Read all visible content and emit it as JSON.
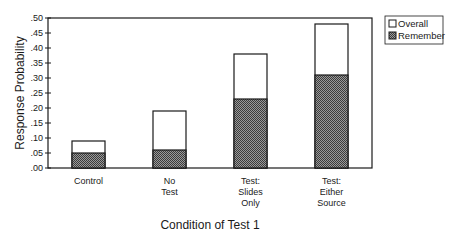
{
  "chart_data": {
    "type": "bar",
    "stacked_overlay": true,
    "title": "",
    "xlabel": "Condition of Test 1",
    "ylabel": "Response Probability",
    "ylim": [
      0,
      0.5
    ],
    "yticks": [
      ".00",
      ".05",
      ".10",
      ".15",
      ".20",
      ".25",
      ".30",
      ".35",
      ".40",
      ".45",
      ".50"
    ],
    "grid": false,
    "legend_position": "top-right, outside plot",
    "categories": [
      [
        "Control"
      ],
      [
        "No",
        "Test"
      ],
      [
        "Test:",
        "Slides",
        "Only"
      ],
      [
        "Test:",
        "Either",
        "Source"
      ]
    ],
    "series": [
      {
        "name": "Overall",
        "fill": "#ffffff",
        "pattern": "none",
        "values": [
          0.09,
          0.19,
          0.38,
          0.48
        ]
      },
      {
        "name": "Remember",
        "fill": "#6e6e6e",
        "pattern": "dark-checker",
        "values": [
          0.05,
          0.06,
          0.23,
          0.31
        ]
      }
    ]
  },
  "legend": {
    "items": [
      {
        "label": "Overall",
        "swatch": "open-square"
      },
      {
        "label": "Remember",
        "swatch": "hatched-square"
      }
    ]
  },
  "colors": {
    "axis": "#1a1a1a",
    "bar_outline": "#1a1a1a",
    "remember_dark": "#4a4a4a",
    "remember_light": "#9a9a9a"
  }
}
